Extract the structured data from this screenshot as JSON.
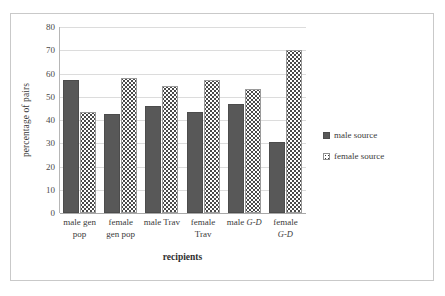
{
  "chart_data": {
    "type": "bar",
    "title": "",
    "xlabel": "recipients",
    "ylabel": "percentage of pairs",
    "ylim": [
      0,
      80
    ],
    "yticks": [
      0,
      10,
      20,
      30,
      40,
      50,
      60,
      70,
      80
    ],
    "grid": true,
    "legend_position": "right",
    "categories": [
      "male gen pop",
      "female gen pop",
      "male Trav",
      "female Trav",
      "male G-D",
      "female G-D"
    ],
    "category_lines": [
      [
        "male gen",
        "pop"
      ],
      [
        "female",
        "gen pop"
      ],
      [
        "male Trav",
        ""
      ],
      [
        "female",
        "Trav"
      ],
      [
        "male ",
        "G-D"
      ],
      [
        "female",
        "G-D"
      ]
    ],
    "series": [
      {
        "name": "male source",
        "values": [
          57,
          42.5,
          46,
          43.5,
          47,
          30.5
        ],
        "color": "#585858",
        "pattern": "solid"
      },
      {
        "name": "female source",
        "values": [
          43.5,
          58,
          54.5,
          57,
          53.5,
          70
        ],
        "color": "#ffffff",
        "pattern": "dotted"
      }
    ]
  },
  "axes": {
    "y_title": "percentage of pairs",
    "x_title": "recipients",
    "y_ticks": [
      "80",
      "70",
      "60",
      "50",
      "40",
      "30",
      "20",
      "10",
      "0"
    ]
  },
  "legend": {
    "items": [
      {
        "label": "male source"
      },
      {
        "label": "female source"
      }
    ]
  },
  "x_labels": [
    {
      "line1": "male gen",
      "line2": "pop",
      "italic1": "",
      "italic2": ""
    },
    {
      "line1": "female",
      "line2": "gen pop",
      "italic1": "",
      "italic2": ""
    },
    {
      "line1": "male Trav",
      "line2": "",
      "italic1": "",
      "italic2": ""
    },
    {
      "line1": "female",
      "line2": "Trav",
      "italic1": "",
      "italic2": ""
    },
    {
      "line1": "male ",
      "line2": "",
      "italic1": "G-D",
      "italic2": ""
    },
    {
      "line1": "female",
      "line2": "",
      "italic1": "",
      "italic2": "G-D"
    }
  ],
  "caption": {
    "sliver_text": ""
  }
}
